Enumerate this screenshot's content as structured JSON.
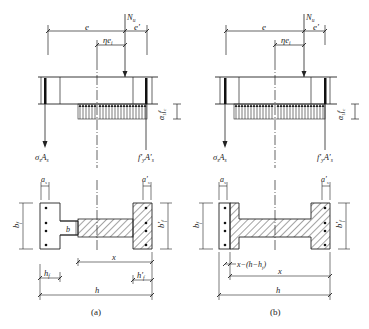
{
  "figure": {
    "panels": [
      {
        "id": "a",
        "caption": "(a)",
        "labels": {
          "axial_force": "N",
          "axial_force_sub": "u",
          "ecc_e": "e",
          "ecc_e_prime": "e'",
          "eta_e": "ηe",
          "eta_e_sub": "i",
          "steel_tension": "σ",
          "steel_tension_sub": "s",
          "steel_tension_A": "A",
          "steel_tension_A_sub": "s",
          "steel_comp": "f'",
          "steel_comp_sub": "y",
          "steel_comp_A": "A'",
          "steel_comp_A_sub": "s",
          "stress_block": "α",
          "stress_block_sub": "1",
          "stress_block_f": "f",
          "stress_block_f_sub": "c",
          "a_s": "a",
          "a_s_sub": "s",
          "a_s_prime": "a'",
          "a_s_prime_sub": "s",
          "b_f": "b",
          "b_f_sub": "f",
          "b_f_prime": "b'",
          "b_f_prime_sub": "f",
          "b_web": "b",
          "x": "x",
          "h_f": "h",
          "h_f_sub": "f",
          "h_f_prime": "h'",
          "h_f_prime_sub": "f",
          "h": "h"
        }
      },
      {
        "id": "b",
        "caption": "(b)",
        "labels": {
          "axial_force": "N",
          "axial_force_sub": "u",
          "ecc_e": "e",
          "ecc_e_prime": "e'",
          "eta_e": "ηe",
          "eta_e_sub": "i",
          "steel_tension": "σ",
          "steel_tension_sub": "s",
          "steel_tension_A": "A",
          "steel_tension_A_sub": "s",
          "steel_comp": "f'",
          "steel_comp_sub": "y",
          "steel_comp_A": "A'",
          "steel_comp_A_sub": "s",
          "stress_block": "α",
          "stress_block_sub": "1",
          "stress_block_f": "f",
          "stress_block_f_sub": "c",
          "a_s": "a",
          "a_s_sub": "s",
          "a_s_prime": "a'",
          "a_s_prime_sub": "s",
          "b_f": "b",
          "b_f_sub": "f",
          "b_f_prime": "b'",
          "b_f_prime_sub": "f",
          "x_minus": "x−(h−h",
          "x_minus_sub": "f",
          "x_minus_close": ")",
          "x": "x",
          "h": "h"
        }
      }
    ]
  }
}
